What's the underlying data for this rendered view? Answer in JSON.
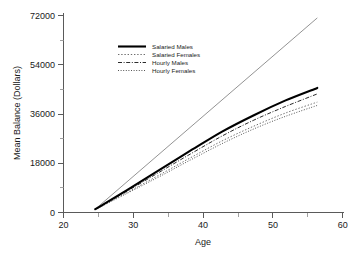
{
  "chart_data": {
    "type": "line",
    "title": "",
    "xlabel": "Age",
    "ylabel": "Mean Balance (Dollars)",
    "xlim": [
      20,
      64
    ],
    "ylim": [
      0,
      75000
    ],
    "grid": false,
    "legend_position": "upper-left-center",
    "x_ticks": [
      20,
      30,
      40,
      50,
      60
    ],
    "x_tick_labels": [
      "20",
      "30",
      "40",
      "50",
      "60"
    ],
    "x_minor_ticks": [
      25,
      35,
      45,
      55
    ],
    "y_ticks": [
      0,
      18000,
      36000,
      54000,
      72000
    ],
    "y_tick_labels": [
      "0",
      "18000",
      "36000",
      "54000",
      "72000"
    ],
    "y_minor_ticks": [
      9000,
      27000,
      45000,
      63000
    ],
    "x": [
      25,
      30,
      35,
      40,
      45,
      50,
      55,
      60
    ],
    "series": [
      {
        "name": "Salaried Males",
        "style": "solid",
        "width": 2.1,
        "color": "#000000",
        "values": [
          1200,
          8200,
          15400,
          22600,
          29600,
          35600,
          41000,
          45600
        ]
      },
      {
        "name": "Salaried Females",
        "style": "dotted",
        "width": 1.0,
        "color": "#6e6e6e",
        "values": [
          1100,
          7300,
          13600,
          20000,
          26200,
          31600,
          36400,
          40400
        ]
      },
      {
        "name": "Hourly Males",
        "style": "dash-dot",
        "width": 1.0,
        "color": "#2b2b2b",
        "values": [
          1150,
          7800,
          14600,
          21400,
          28000,
          33800,
          38800,
          43400
        ]
      },
      {
        "name": "Hourly Females",
        "style": "fine-dotted",
        "width": 1.0,
        "color": "#555555",
        "values": [
          1050,
          7000,
          13000,
          19200,
          25200,
          30600,
          35200,
          39200
        ]
      },
      {
        "name": "Reference Line",
        "style": "thin-solid",
        "width": 0.8,
        "color": "#777777",
        "in_legend": false,
        "values": [
          1200,
          11200,
          21200,
          31200,
          41200,
          51200,
          61200,
          71200
        ]
      }
    ]
  },
  "legend": {
    "entries": [
      {
        "label": "Salaried Males"
      },
      {
        "label": "Salaried Females"
      },
      {
        "label": "Hourly Males"
      },
      {
        "label": "Hourly Females"
      }
    ]
  },
  "axes": {
    "y_title": "Mean Balance (Dollars)",
    "x_title": "Age",
    "y_labels": [
      "72000",
      "54000",
      "36000",
      "18000",
      "0"
    ],
    "x_labels": [
      "20",
      "30",
      "40",
      "50",
      "60"
    ]
  }
}
